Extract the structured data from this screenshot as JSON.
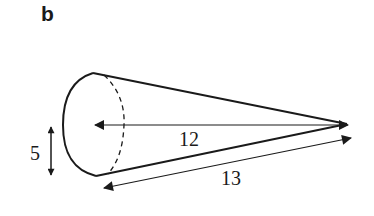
{
  "figure": {
    "panel_label": "b",
    "shape": "cone",
    "labels": {
      "radius": "5",
      "height": "12",
      "slant_height": "13"
    },
    "colors": {
      "stroke": "#1a1a1a",
      "background": "#ffffff"
    }
  }
}
